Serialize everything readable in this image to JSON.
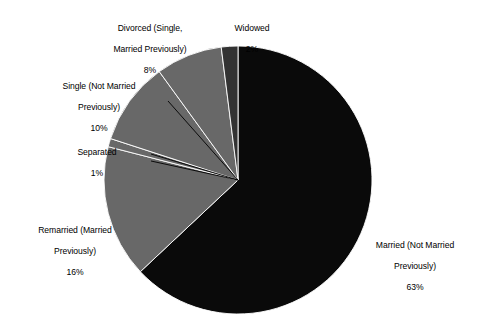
{
  "chart_data": {
    "type": "pie",
    "title": "",
    "subtitle": "",
    "xlabel": "",
    "ylabel": "",
    "legend_position": "none",
    "grid": false,
    "units": "percent",
    "label_format": "{name}\n{value}%",
    "start_angle_deg": 0,
    "direction": "clockwise",
    "categories": [
      "Married (Not Married Previously)",
      "Remarried (Married Previously)",
      "Separated",
      "Single (Not Married Previously)",
      "Divorced (Single, Married Previously)",
      "Widowed"
    ],
    "values": [
      63,
      16,
      1,
      10,
      8,
      2
    ],
    "total": 100,
    "slices": [
      {
        "id": "married",
        "name": "Married (Not Married",
        "name_line2": "Previously)",
        "name_full": "Married (Not Married Previously)",
        "value": 63,
        "value_label": "63%",
        "color": "#0a0a0a",
        "start_deg": 0,
        "end_deg": 226.8,
        "has_leader": false
      },
      {
        "id": "remarried",
        "name": "Remarried (Married",
        "name_line2": "Previously)",
        "name_full": "Remarried (Married Previously)",
        "value": 16,
        "value_label": "16%",
        "color": "#686868",
        "start_deg": 226.8,
        "end_deg": 284.4,
        "has_leader": false
      },
      {
        "id": "separated",
        "name": "Separated",
        "name_line2": "",
        "name_full": "Separated",
        "value": 1,
        "value_label": "1%",
        "color": "#686868",
        "start_deg": 284.4,
        "end_deg": 288.0,
        "has_leader": true
      },
      {
        "id": "single",
        "name": "Single (Not Married",
        "name_line2": "Previously)",
        "name_full": "Single (Not Married Previously)",
        "value": 10,
        "value_label": "10%",
        "color": "#686868",
        "start_deg": 288.0,
        "end_deg": 324.0,
        "has_leader": true
      },
      {
        "id": "divorced",
        "name": "Divorced (Single,",
        "name_line2": "Married Previously)",
        "name_full": "Divorced (Single, Married Previously)",
        "value": 8,
        "value_label": "8%",
        "color": "#686868",
        "start_deg": 324.0,
        "end_deg": 352.8,
        "has_leader": false
      },
      {
        "id": "widowed",
        "name": "Widowed",
        "name_line2": "",
        "name_full": "Widowed",
        "value": 2,
        "value_label": "2%",
        "color": "#333333",
        "start_deg": 352.8,
        "end_deg": 360.0,
        "has_leader": false
      }
    ],
    "geometry": {
      "center_x": 238,
      "center_y": 180,
      "radius": 134
    },
    "palette": {
      "background": "#ffffff",
      "black_slice": "#0a0a0a",
      "gray_slice": "#686868",
      "dark_gray_slice": "#333333",
      "outline": "#ffffff",
      "text": "#000000"
    }
  }
}
